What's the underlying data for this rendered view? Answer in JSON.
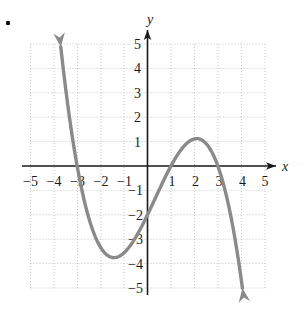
{
  "figure": {
    "marker": "•",
    "axis_labels": {
      "x": "x",
      "y": "y"
    },
    "x_ticks": [
      {
        "value": -5,
        "label": "−5"
      },
      {
        "value": -4,
        "label": "−4"
      },
      {
        "value": -3,
        "label": "−3"
      },
      {
        "value": -2,
        "label": "−2"
      },
      {
        "value": -1,
        "label": "−1"
      },
      {
        "value": 1,
        "label": "1"
      },
      {
        "value": 2,
        "label": "2"
      },
      {
        "value": 3,
        "label": "3"
      },
      {
        "value": 4,
        "label": "4"
      },
      {
        "value": 5,
        "label": "5"
      }
    ],
    "y_ticks": [
      {
        "value": 5,
        "label": "5"
      },
      {
        "value": 4,
        "label": "4"
      },
      {
        "value": 3,
        "label": "3"
      },
      {
        "value": 2,
        "label": "2"
      },
      {
        "value": 1,
        "label": "1"
      },
      {
        "value": -1,
        "label": "−1"
      },
      {
        "value": -2,
        "label": "−2"
      },
      {
        "value": -3,
        "label": "−3"
      },
      {
        "value": -4,
        "label": "−4"
      },
      {
        "value": -5,
        "label": "−5"
      }
    ]
  },
  "colors": {
    "curve": "#8a8a8a",
    "axis": "#1a1a1a",
    "grid": "#c8c8c8",
    "label": "#1a1a1a"
  },
  "chart_data": {
    "type": "line",
    "title": "",
    "xlabel": "x",
    "ylabel": "y",
    "xlim": [
      -5,
      5
    ],
    "ylim": [
      -5,
      5
    ],
    "grid": true,
    "legend": "none",
    "series": [
      {
        "name": "cubic",
        "description": "Cubic polynomial y = -(2/9)(x+3)(x-1)(x-3)",
        "x_intercepts": [
          -3,
          1,
          3
        ],
        "y_intercept": 2,
        "local_maximum": {
          "x": -1.3,
          "y": 2.9
        },
        "local_minimum": {
          "x": 2.1,
          "y": -0.9
        },
        "end_behavior": {
          "left": "down",
          "right": "up"
        },
        "arrows": [
          "start",
          "end"
        ],
        "x": [
          -3.9,
          -3.7,
          -3.5,
          -3.3,
          -3.1,
          -3.0,
          -2.8,
          -2.6,
          -2.4,
          -2.2,
          -2.0,
          -1.8,
          -1.6,
          -1.4,
          -1.2,
          -1.0,
          -0.8,
          -0.6,
          -0.4,
          -0.2,
          0.0,
          0.2,
          0.4,
          0.6,
          0.8,
          1.0,
          1.2,
          1.4,
          1.6,
          1.8,
          2.0,
          2.2,
          2.4,
          2.6,
          2.8,
          3.0,
          3.2,
          3.4,
          3.6,
          3.8,
          4.0,
          4.15
        ],
        "y": [
          -5.0,
          -3.9,
          -2.9,
          -2.0,
          -1.2,
          -0.8,
          -0.1,
          0.6,
          1.2,
          1.7,
          2.2,
          2.5,
          2.7,
          2.9,
          2.9,
          2.8,
          2.7,
          2.4,
          2.1,
          1.6,
          2.0,
          1.3,
          1.1,
          0.8,
          0.4,
          0.0,
          -0.4,
          -0.6,
          -0.8,
          -0.9,
          -0.9,
          -0.8,
          -0.6,
          -0.2,
          0.3,
          0.8,
          1.6,
          2.5,
          3.5,
          4.6,
          5.0,
          5.0
        ]
      }
    ]
  }
}
